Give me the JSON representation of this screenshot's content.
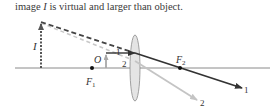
{
  "caption": {
    "prefix": "image ",
    "symbol": "I",
    "suffix": " is virtual and larger than object."
  },
  "diagram": {
    "labels": {
      "image": "I",
      "object": "O",
      "focal_point_1": "F",
      "focal_point_1_sub": "1",
      "focal_point_2": "F",
      "focal_point_2_sub": "2",
      "ray_1_near": "1",
      "ray_2_near": "2",
      "ray_1_end": "1",
      "ray_2_end": "2"
    },
    "colors": {
      "axis": "#8a8a8a",
      "ray_1": "#333333",
      "ray_2": "#c4c4c4",
      "object": "#a8a8a8",
      "image": "#555555",
      "lens_fill": "#e4e4e4",
      "lens_stroke": "#8a8a8a"
    }
  }
}
